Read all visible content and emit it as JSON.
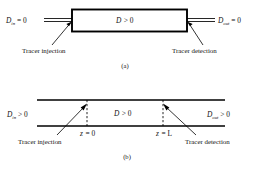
{
  "figure": {
    "panel_a": {
      "caption": "(a)",
      "inlet_label": {
        "symbol": "D",
        "subscript": "in",
        "relation": "= 0"
      },
      "outlet_label": {
        "symbol": "D",
        "subscript": "out",
        "relation": "= 0"
      },
      "vessel_label": {
        "symbol": "D",
        "relation": "> 0"
      },
      "injection_label": "Tracer injection",
      "detection_label": "Tracer detection"
    },
    "panel_b": {
      "caption": "(b)",
      "inlet_label": {
        "symbol": "D",
        "subscript": "in",
        "relation": "> 0"
      },
      "outlet_label": {
        "symbol": "D",
        "subscript": "out",
        "relation": "> 0"
      },
      "vessel_label": {
        "symbol": "D",
        "relation": "> 0"
      },
      "injection_label": "Tracer injection",
      "detection_label": "Tracer detection",
      "position_start": {
        "symbol": "z",
        "relation": "= 0"
      },
      "position_end": {
        "symbol": "z",
        "relation": "= L"
      }
    }
  },
  "colors": {
    "ink": "#000000",
    "background": "#ffffff"
  }
}
